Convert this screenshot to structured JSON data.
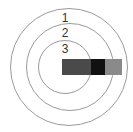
{
  "diagram": {
    "type": "concentric-circles-with-bar",
    "rings": [
      {
        "label": "1",
        "cx": 69,
        "cy": 67,
        "r": 59
      },
      {
        "label": "2",
        "cx": 70,
        "cy": 67,
        "r": 44
      },
      {
        "label": "3",
        "cx": 65,
        "cy": 67,
        "r": 27
      }
    ],
    "labels": [
      {
        "text": "1",
        "x": 65,
        "y": 18
      },
      {
        "text": "2",
        "x": 65,
        "y": 33
      },
      {
        "text": "3",
        "x": 65,
        "y": 49
      }
    ],
    "bar": {
      "x": 62,
      "y": 59,
      "height": 16,
      "segments": [
        {
          "name": "inner-segment",
          "x": 62,
          "width": 29,
          "color": "#4a4a4a"
        },
        {
          "name": "middle-segment",
          "x": 91,
          "width": 14,
          "color": "#111111"
        },
        {
          "name": "outer-segment",
          "x": 105,
          "width": 17,
          "color": "#8a8a8a"
        }
      ]
    }
  }
}
